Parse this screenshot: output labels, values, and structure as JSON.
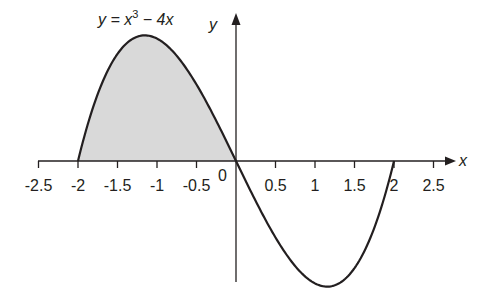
{
  "chart_data": {
    "type": "line",
    "equation": {
      "prefix": "y = x",
      "exponent": "3",
      "suffix": " − 4x"
    },
    "xlabel": "x",
    "ylabel": "y",
    "origin_label": "0",
    "xlim": [
      -2.5,
      2.5
    ],
    "ylim": [
      -3.08,
      3.08
    ],
    "grid": false,
    "x_ticks": [
      -2.5,
      -2,
      -1.5,
      -1,
      -0.5,
      0.5,
      1,
      1.5,
      2,
      2.5
    ],
    "x_tick_labels": [
      "-2.5",
      "-2",
      "-1.5",
      "-1",
      "-0.5",
      "0.5",
      "1",
      "1.5",
      "2",
      "2.5"
    ],
    "series": [
      {
        "name": "y = x^3 - 4x",
        "domain": [
          -2,
          2
        ],
        "x": [
          -2,
          -1.5,
          -1.155,
          -1,
          -0.5,
          0,
          0.5,
          1,
          1.155,
          1.5,
          2
        ],
        "y": [
          0,
          2.625,
          3.079,
          3,
          1.875,
          0,
          -1.875,
          -3,
          -3.079,
          -2.625,
          0
        ]
      }
    ],
    "shaded_region": {
      "from": -2,
      "to": 0,
      "color": "#d9d9d9",
      "description": "area between curve and x-axis for -2 ≤ x ≤ 0"
    },
    "colors": {
      "curve": "#231f20",
      "axis": "#231f20",
      "fill": "#d9d9d9"
    }
  }
}
